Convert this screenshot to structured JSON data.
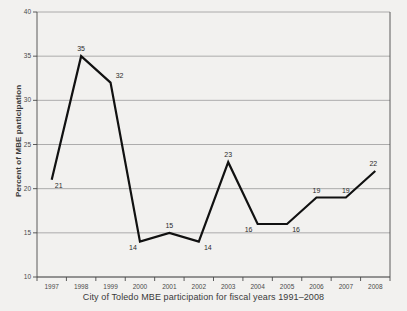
{
  "chart_data": {
    "type": "line",
    "title": "",
    "xlabel": "City of Toledo MBE participation for fiscal years 1991–2008",
    "ylabel": "Percent of MBE participation",
    "categories": [
      "1997",
      "1998",
      "1999",
      "2000",
      "2001",
      "2002",
      "2003",
      "2004",
      "2005",
      "2006",
      "2007",
      "2008"
    ],
    "values": [
      21,
      35,
      32,
      14,
      15,
      14,
      23,
      16,
      16,
      19,
      19,
      22
    ],
    "point_labels": [
      "21",
      "35",
      "32",
      "14",
      "15",
      "14",
      "23",
      "16",
      "16",
      "19",
      "19",
      "22"
    ],
    "ylim": [
      10,
      40
    ],
    "yticks": [
      10,
      15,
      20,
      25,
      30,
      35,
      40
    ],
    "ytick_labels": [
      "10",
      "15",
      "20",
      "25",
      "30",
      "35",
      "40"
    ],
    "grid": true,
    "legend": "none",
    "series_color": "#111111",
    "grid_color": "#9a9a9a",
    "axis_color": "#4a4a4a",
    "background": "#f2f1ef"
  }
}
